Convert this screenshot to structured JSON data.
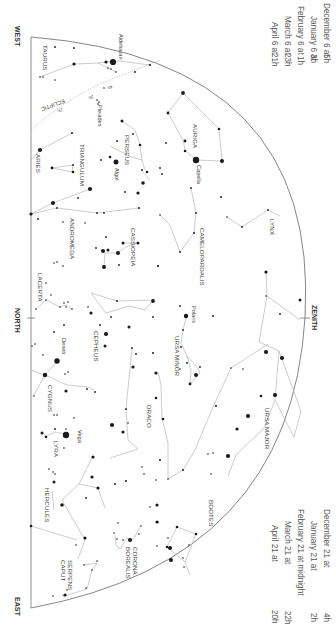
{
  "chart": {
    "orientation": "rotated-90-clockwise",
    "directions": {
      "west": "WEST",
      "north": "NORTH",
      "east": "EAST",
      "zenith": "ZENITH"
    },
    "ecliptic": {
      "label": "ECLIPTIC",
      "hour_marks": [
        "4h",
        "3h",
        "2h"
      ]
    },
    "times_top": [
      {
        "date": "December 6 at",
        "hour": "5h"
      },
      {
        "date": "January 6 at",
        "hour": "3h"
      },
      {
        "date": "February 6 at",
        "hour": "1h"
      },
      {
        "date": "March 6 at",
        "hour": "23h"
      },
      {
        "date": "April 6 at",
        "hour": "21h"
      }
    ],
    "times_bottom": [
      {
        "date": "December 21 at",
        "hour": "4h"
      },
      {
        "date": "January 21 at",
        "hour": "2h"
      },
      {
        "date": "February 21 at midnight",
        "hour": ""
      },
      {
        "date": "March 21 at",
        "hour": "22h"
      },
      {
        "date": "April 21 at",
        "hour": "20h"
      }
    ],
    "constellations": [
      "TAURUS",
      "ARIES",
      "TRIANGULUM",
      "PERSEUS",
      "AURIGA",
      "ANDROMEDA",
      "CASSIOPEIA",
      "CAMELOPARDALIS",
      "LYNX",
      "LACERTA",
      "CEPHEUS",
      "URSA MINOR",
      "URSA MAJOR",
      "CYGNUS",
      "LYRA",
      "DRACO",
      "HERCULES",
      "BOOTES",
      "CORONA BOREALIS",
      "SERPENS CAPUT"
    ],
    "stars": [
      "Aldebaran",
      "Pleiades",
      "Algol",
      "Capella",
      "Polaris",
      "Deneb",
      "Vega"
    ],
    "colors": {
      "background": "#ffffff",
      "line": "#aaaaaa",
      "horizon": "#666666",
      "star": "#1a1a1a",
      "text": "#444444"
    }
  }
}
